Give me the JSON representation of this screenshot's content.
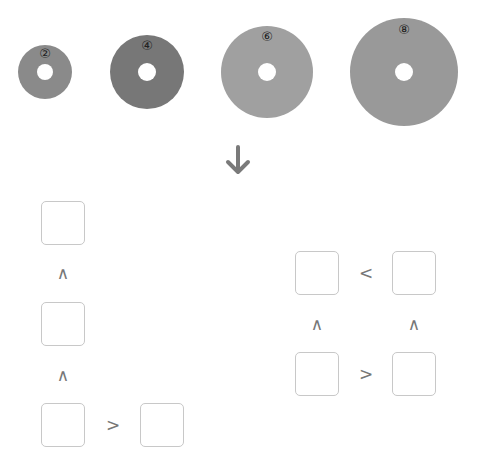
{
  "discs": [
    {
      "label": "②",
      "color": "#8a8a8a"
    },
    {
      "label": "④",
      "color": "#777777"
    },
    {
      "label": "⑥",
      "color": "#a0a0a0"
    },
    {
      "label": "⑧",
      "color": "#999999"
    }
  ],
  "arrow": {
    "icon": "arrow-down-icon",
    "color": "#7a7a7a"
  },
  "left_group": {
    "symbols": [
      "∧",
      "∧",
      ">"
    ]
  },
  "right_group": {
    "symbols": [
      "<",
      "∧",
      "∧",
      ">"
    ]
  }
}
